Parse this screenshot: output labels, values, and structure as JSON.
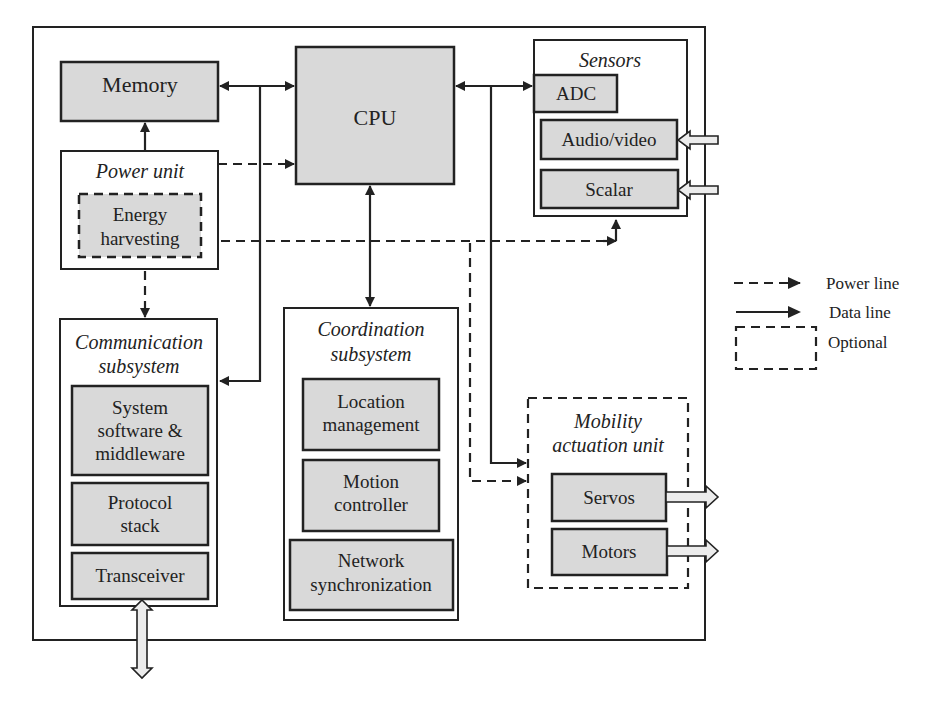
{
  "diagram": {
    "type": "block-diagram",
    "title": "",
    "blocks": {
      "memory": "Memory",
      "cpu": "CPU",
      "power_unit": {
        "title": "Power unit",
        "energy_harvesting": [
          "Energy",
          "harvesting"
        ]
      },
      "sensors": {
        "title": "Sensors",
        "adc": "ADC",
        "audio_video": "Audio/video",
        "scalar": "Scalar"
      },
      "communication": {
        "title": [
          "Communication",
          "subsystem"
        ],
        "system_software": [
          "System",
          "software &",
          "middleware"
        ],
        "protocol_stack": [
          "Protocol",
          "stack"
        ],
        "transceiver": "Transceiver"
      },
      "coordination": {
        "title": [
          "Coordination",
          "subsystem"
        ],
        "location_management": [
          "Location",
          "management"
        ],
        "motion_controller": [
          "Motion",
          "controller"
        ],
        "network_sync": [
          "Network",
          "synchronization"
        ]
      },
      "mobility": {
        "title": [
          "Mobility",
          "actuation unit"
        ],
        "servos": "Servos",
        "motors": "Motors"
      }
    },
    "legend": {
      "power_line": "Power line",
      "data_line": "Data line",
      "optional": "Optional"
    },
    "connections": [
      {
        "from": "Memory",
        "to": "CPU",
        "type": "data",
        "bidirectional": true
      },
      {
        "from": "Power unit",
        "to": "Memory",
        "type": "data"
      },
      {
        "from": "Power unit",
        "to": "CPU",
        "type": "power"
      },
      {
        "from": "Power unit",
        "to": "Sensors",
        "type": "power"
      },
      {
        "from": "Power unit",
        "to": "Communication subsystem",
        "type": "power"
      },
      {
        "from": "Power unit",
        "to": "Mobility actuation unit",
        "type": "power"
      },
      {
        "from": "Memory/CPU bus",
        "to": "Communication subsystem",
        "type": "data"
      },
      {
        "from": "CPU",
        "to": "Coordination subsystem",
        "type": "data",
        "bidirectional": true
      },
      {
        "from": "CPU",
        "to": "ADC",
        "type": "data",
        "bidirectional": true
      },
      {
        "from": "CPU/ADC bus",
        "to": "Mobility actuation unit",
        "type": "data"
      }
    ]
  }
}
